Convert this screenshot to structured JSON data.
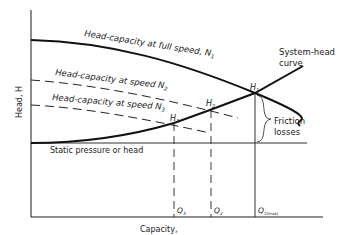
{
  "diagram": {
    "axes": {
      "y_label": "Head, H",
      "x_label": "Capacity,"
    },
    "curves": {
      "full_speed": {
        "label": "Head-capacity at full speed,",
        "speed": "N",
        "speed_sub": "1"
      },
      "speed_2": {
        "label": "Head-capacity at",
        "speed_word": "speed",
        "speed": "N",
        "speed_sub": "2"
      },
      "speed_3": {
        "label": "Head-capacity at",
        "speed_word": "speed",
        "speed": "N",
        "speed_sub": "3"
      },
      "system_head": {
        "line1": "System-head",
        "line2": "curve"
      },
      "static": {
        "label": "Static pressure or head"
      }
    },
    "points": {
      "h1": {
        "label": "H",
        "sub": "1"
      },
      "h2": {
        "label": "H",
        "sub": "2"
      },
      "h3": {
        "label": "H",
        "sub": "3"
      }
    },
    "capacities": {
      "q3": {
        "label": "Q",
        "sub": "3"
      },
      "q2": {
        "label": "Q",
        "sub": "2"
      },
      "q1": {
        "label": "Q",
        "sub": "1(max)"
      }
    },
    "annotation": {
      "line1": "Friction",
      "line2": "losses"
    },
    "colors": {
      "line": "#1a1a1a",
      "text": "#222222",
      "background": "#ffffff"
    }
  }
}
